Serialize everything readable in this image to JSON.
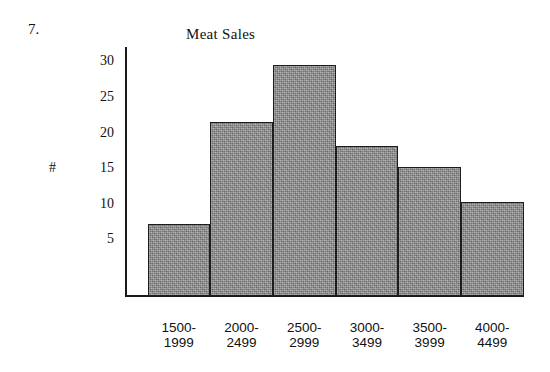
{
  "question_number": "7.",
  "axis_label": "#",
  "chart_data": {
    "type": "bar",
    "title": "Meat Sales",
    "xlabel": "",
    "ylabel": "#",
    "categories": [
      "1500-1999",
      "2000-2499",
      "2500-2999",
      "3000-3499",
      "3500-3999",
      "4000-4499"
    ],
    "category_lines": [
      [
        "1500-",
        "1999"
      ],
      [
        "2000-",
        "2499"
      ],
      [
        "2500-",
        "2999"
      ],
      [
        "3000-",
        "3499"
      ],
      [
        "3500-",
        "3999"
      ],
      [
        "4000-",
        "4499"
      ]
    ],
    "values": [
      7.2,
      21.5,
      29.5,
      18.1,
      15.1,
      10.2
    ],
    "ylim": [
      0,
      31
    ],
    "yticks": [
      5,
      10,
      15,
      20,
      25,
      30
    ],
    "ytick_labels": [
      "5",
      "10",
      "15",
      "20",
      "25",
      "30"
    ],
    "grid": false,
    "legend": null,
    "bar_fill_color": "#8e8e8e",
    "bar_edge_color": "#1d1d1d",
    "axis_color": "#1a1a1a",
    "background_color": "#ffffff"
  }
}
